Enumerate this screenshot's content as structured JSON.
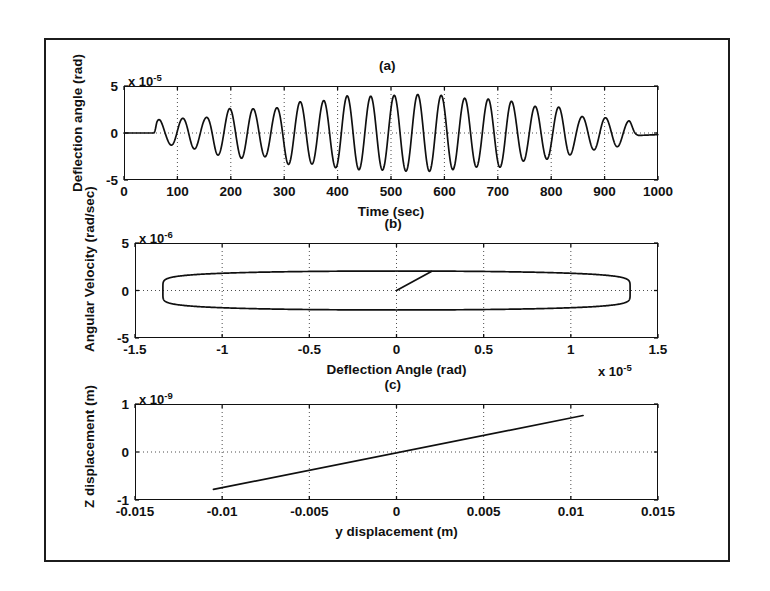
{
  "figure": {
    "background_color": "#ffffff",
    "line_color": "#101010",
    "grid_color": "#4d4d4d",
    "border_color": "#1c1c1c"
  },
  "chart_data": [
    {
      "type": "line",
      "panel": "(a)",
      "title": "(a)",
      "xlabel": "Time (sec)",
      "ylabel": "Deflection angle (rad)",
      "y_exponent_label": "x 10",
      "y_exponent_power": "-5",
      "x_exponent_label": "",
      "xlim": [
        0,
        1000
      ],
      "ylim": [
        -5,
        5
      ],
      "xticks": [
        0,
        100,
        200,
        300,
        400,
        500,
        600,
        700,
        800,
        900,
        1000
      ],
      "xticklabels": [
        "0",
        "100",
        "200",
        "300",
        "400",
        "500",
        "600",
        "700",
        "800",
        "900",
        "1000"
      ],
      "yticks": [
        -5,
        0,
        5
      ],
      "yticklabels": [
        "-5",
        "0",
        "5"
      ],
      "grid": true,
      "grid_style": "dotted",
      "description": "Amplitude-modulated oscillation: flat near zero until t=55 s, then growing oscillation peaking near 4e-5 rad around t=400-600 s, then decaying to flat near zero by t=960 s.",
      "series": [
        {
          "name": "deflection angle",
          "carrier_period_sec": 44.0,
          "envelope_points": [
            {
              "t": 0,
              "amp": 0.0
            },
            {
              "t": 55,
              "amp": 0.0
            },
            {
              "t": 62,
              "amp": 1.45
            },
            {
              "t": 80,
              "amp": 1.2
            },
            {
              "t": 105,
              "amp": 1.55
            },
            {
              "t": 130,
              "amp": 1.7
            },
            {
              "t": 150,
              "amp": 1.6
            },
            {
              "t": 175,
              "amp": 2.35
            },
            {
              "t": 200,
              "amp": 2.6
            },
            {
              "t": 225,
              "amp": 2.7
            },
            {
              "t": 255,
              "amp": 2.5
            },
            {
              "t": 280,
              "amp": 2.6
            },
            {
              "t": 310,
              "amp": 3.35
            },
            {
              "t": 350,
              "amp": 3.3
            },
            {
              "t": 385,
              "amp": 3.5
            },
            {
              "t": 410,
              "amp": 3.95
            },
            {
              "t": 450,
              "amp": 3.9
            },
            {
              "t": 490,
              "amp": 3.95
            },
            {
              "t": 520,
              "amp": 4.05
            },
            {
              "t": 560,
              "amp": 4.1
            },
            {
              "t": 600,
              "amp": 4.0
            },
            {
              "t": 640,
              "amp": 3.7
            },
            {
              "t": 670,
              "amp": 3.6
            },
            {
              "t": 710,
              "amp": 3.65
            },
            {
              "t": 745,
              "amp": 3.0
            },
            {
              "t": 780,
              "amp": 2.8
            },
            {
              "t": 820,
              "amp": 2.75
            },
            {
              "t": 855,
              "amp": 1.75
            },
            {
              "t": 885,
              "amp": 1.8
            },
            {
              "t": 915,
              "amp": 1.5
            },
            {
              "t": 945,
              "amp": 1.3
            },
            {
              "t": 962,
              "amp": 0.35
            },
            {
              "t": 1000,
              "amp": 0.15
            }
          ]
        }
      ]
    },
    {
      "type": "line",
      "panel": "(b)",
      "title": "(b)",
      "xlabel": "Deflection Angle (rad)",
      "ylabel": "Angular Velocity (rad/sec)",
      "y_exponent_label": "x 10",
      "y_exponent_power": "-6",
      "x_exponent_label": "x 10",
      "x_exponent_power": "-5",
      "xlim": [
        -1.5,
        1.5
      ],
      "ylim": [
        -5,
        5
      ],
      "xticks": [
        -1.5,
        -1,
        -0.5,
        0,
        0.5,
        1,
        1.5
      ],
      "xticklabels": [
        "-1.5",
        "-1",
        "-0.5",
        "0",
        "0.5",
        "1",
        "1.5"
      ],
      "yticks": [
        -5,
        0,
        5
      ],
      "yticklabels": [
        "-5",
        "0",
        "5"
      ],
      "grid": true,
      "grid_style": "dotted",
      "description": "Phase-plane portrait: flat elongated closed orbit (ellipse-like limit cycle) spanning x from -1.33e-5 to 1.35e-5 rad and y from -2.1e-6 to 2.1e-6 rad/sec, plus a short straight transient segment from the origin (0,0) rising to (0.2e-5, 2.0e-6).",
      "orbit": {
        "x_half_width": 1.34,
        "y_half_height": 2.05,
        "flatness": 0.92
      },
      "transient_segment": {
        "from": [
          0.0,
          0.0
        ],
        "to": [
          0.2,
          2.0
        ]
      }
    },
    {
      "type": "line",
      "panel": "(c)",
      "title": "(c)",
      "xlabel": "y displacement (m)",
      "ylabel": "Z displacement (m)",
      "y_exponent_label": "x 10",
      "y_exponent_power": "-9",
      "xlim": [
        -0.015,
        0.015
      ],
      "ylim": [
        -1,
        1
      ],
      "xticks": [
        -0.015,
        -0.01,
        -0.005,
        0,
        0.005,
        0.01,
        0.015
      ],
      "xticklabels": [
        "-0.015",
        "-0.01",
        "-0.005",
        "0",
        "0.005",
        "0.01",
        "0.015"
      ],
      "yticks": [
        -1,
        0,
        1
      ],
      "yticklabels": [
        "-1",
        "0",
        "1"
      ],
      "grid": true,
      "grid_style": "dotted",
      "description": "Straight sloped line from (-0.0105 m, -0.78e-9 m) to (0.0107 m, 0.76e-9 m) passing through the origin.",
      "line_points": [
        {
          "y": -0.0105,
          "z": -0.78
        },
        {
          "y": 0.0107,
          "z": 0.76
        }
      ]
    }
  ]
}
